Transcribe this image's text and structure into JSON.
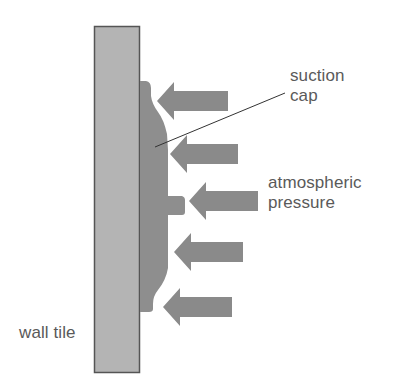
{
  "diagram": {
    "type": "physics-illustration",
    "labels": {
      "suction_cap": [
        "suction",
        "cap"
      ],
      "atmospheric_pressure": [
        "atmospheric",
        "pressure"
      ],
      "wall_tile": "wall tile"
    },
    "colors": {
      "wall_tile_fill": "#b4b4b4",
      "wall_tile_border": "#555555",
      "suction_cap_fill": "#8e8e8e",
      "arrow_fill": "#8a8a8a",
      "leader_line": "#333333",
      "label_text": "#5a5a5a",
      "background": "#ffffff"
    },
    "arrows": [
      {
        "id": 1,
        "direction": "left",
        "tip_x": 157,
        "y": 101,
        "tail_x": 228
      },
      {
        "id": 2,
        "direction": "left",
        "tip_x": 170,
        "y": 154,
        "tail_x": 238
      },
      {
        "id": 3,
        "direction": "left",
        "tip_x": 189,
        "y": 201,
        "tail_x": 258
      },
      {
        "id": 4,
        "direction": "left",
        "tip_x": 174,
        "y": 252,
        "tail_x": 243
      },
      {
        "id": 5,
        "direction": "left",
        "tip_x": 163,
        "y": 307,
        "tail_x": 232
      }
    ]
  }
}
